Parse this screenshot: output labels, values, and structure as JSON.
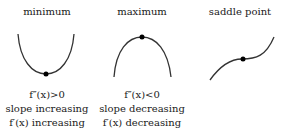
{
  "panels": [
    {
      "title": "minimum",
      "lines": [
        "f″(x)>0",
        "slope increasing",
        "f′(x) increasing"
      ]
    },
    {
      "title": "maximum",
      "lines": [
        "f″(x)<0",
        "slope decreasing",
        "f′(x) decreasing"
      ]
    },
    {
      "title": "saddle point",
      "lines": []
    }
  ],
  "colors": {
    "curve": "#333333",
    "point": "#000000"
  }
}
